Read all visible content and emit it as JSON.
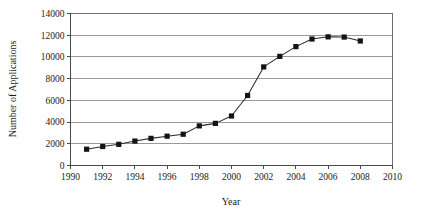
{
  "chart_data": {
    "type": "line",
    "title": "",
    "xlabel": "Year",
    "ylabel": "Number of Applications",
    "xlim": [
      1990,
      2010
    ],
    "ylim": [
      0,
      14000
    ],
    "xticks": [
      1990,
      1992,
      1994,
      1996,
      1998,
      2000,
      2002,
      2004,
      2006,
      2008,
      2010
    ],
    "xtick_labels": [
      "1990",
      "1992",
      "1994",
      "1996",
      "1998",
      "2000",
      "2002",
      "2004",
      "2006",
      "2008",
      "2010"
    ],
    "yticks": [
      0,
      2000,
      4000,
      6000,
      8000,
      10000,
      12000,
      14000
    ],
    "ytick_labels": [
      "0",
      "2000",
      "4000",
      "6000",
      "8000",
      "10000",
      "12000",
      "14000"
    ],
    "grid": true,
    "grid_axis": "y",
    "legend": false,
    "legend_position": "none",
    "marker": "square",
    "line_color": "#2b2b2b",
    "marker_color": "#141414",
    "grid_color": "#8e8e8e",
    "frame_color": "#6f6f6f",
    "x": [
      1991,
      1992,
      1993,
      1994,
      1995,
      1996,
      1997,
      1998,
      1999,
      2000,
      2001,
      2002,
      2003,
      2004,
      2005,
      2006,
      2007,
      2008
    ],
    "values": [
      1500,
      1750,
      1950,
      2250,
      2500,
      2700,
      2880,
      3650,
      3880,
      4560,
      6450,
      9080,
      10050,
      10950,
      11650,
      11850,
      11830,
      11470
    ],
    "series": [
      {
        "name": "Number of Applications",
        "x": [
          1991,
          1992,
          1993,
          1994,
          1995,
          1996,
          1997,
          1998,
          1999,
          2000,
          2001,
          2002,
          2003,
          2004,
          2005,
          2006,
          2007,
          2008
        ],
        "values": [
          1500,
          1750,
          1950,
          2250,
          2500,
          2700,
          2880,
          3650,
          3880,
          4560,
          6450,
          9080,
          10050,
          10950,
          11650,
          11850,
          11830,
          11470
        ]
      }
    ],
    "annotations": []
  }
}
